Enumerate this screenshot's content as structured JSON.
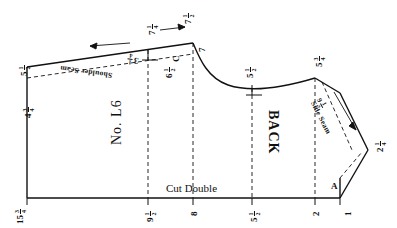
{
  "diagram": {
    "piece_number": "No. L6",
    "piece_label": "BACK",
    "cut_instruction": "Cut Double",
    "line_color": "#111111",
    "background_color": "#ffffff"
  },
  "seam_labels": {
    "shoulder_seam": "Shoulder Seam",
    "side_seam": "Side Seam"
  },
  "notch_labels": {
    "corner_a": "A",
    "marker_c": "C"
  },
  "dimensions": {
    "top_left_edge": {
      "whole": "5",
      "num": "1",
      "den": "2"
    },
    "left_lower": {
      "whole": "4",
      "num": "3",
      "den": "4"
    },
    "bottom_left": {
      "whole": "15",
      "num": "3",
      "den": "4"
    },
    "bottom_mid_left": {
      "whole": "9",
      "num": "1",
      "den": "2"
    },
    "bottom_mid": {
      "whole": "8",
      "num": "",
      "den": ""
    },
    "bottom_center_right": {
      "whole": "5",
      "num": "1",
      "den": "2"
    },
    "bottom_right": {
      "whole": "2",
      "num": "",
      "den": ""
    },
    "bottom_far_right": {
      "whole": "1",
      "num": "",
      "den": ""
    },
    "top_notch_left": {
      "whole": "7",
      "num": "1",
      "den": "4"
    },
    "top_notch_right": {
      "whole": "7",
      "num": "1",
      "den": "2"
    },
    "top_small_c": {
      "whole": "6",
      "num": "1",
      "den": "2"
    },
    "shoulder_measure": {
      "whole": "3",
      "num": "1",
      "den": "4"
    },
    "neck_top": {
      "whole": "5",
      "num": "1",
      "den": "2"
    },
    "shoulder_point": {
      "whole": "5",
      "num": "3",
      "den": "4"
    },
    "side_seam_len": {
      "whole": "9",
      "num": "1",
      "den": "2"
    },
    "right_edge": {
      "whole": "2",
      "num": "1",
      "den": "4"
    },
    "neck_drop": {
      "whole": "7",
      "num": "",
      "den": ""
    }
  }
}
